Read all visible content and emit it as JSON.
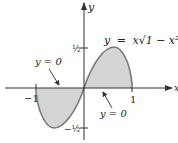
{
  "figure": {
    "equation_label": {
      "lhs": "y",
      "eq": "=",
      "rhs": "x√1 − x²"
    },
    "axis_labels": {
      "x": "x",
      "y": "y"
    },
    "ticks": {
      "x": [
        {
          "value": -1,
          "label": "−1"
        },
        {
          "value": 1,
          "label": "1"
        }
      ],
      "y": [
        {
          "value": 0.5,
          "label": "½"
        },
        {
          "value": -0.5,
          "label": "−½"
        }
      ]
    },
    "annotations": [
      {
        "text": "y = 0",
        "position": "upper-left",
        "points_to": "x-axis segment over [-1,0]"
      },
      {
        "text": "y = 0",
        "position": "lower-right",
        "points_to": "x-axis segment over [0,1]"
      }
    ],
    "colors": {
      "fill": "#d4d4d4",
      "curve": "#7a7a7a",
      "axis": "#333333"
    }
  }
}
